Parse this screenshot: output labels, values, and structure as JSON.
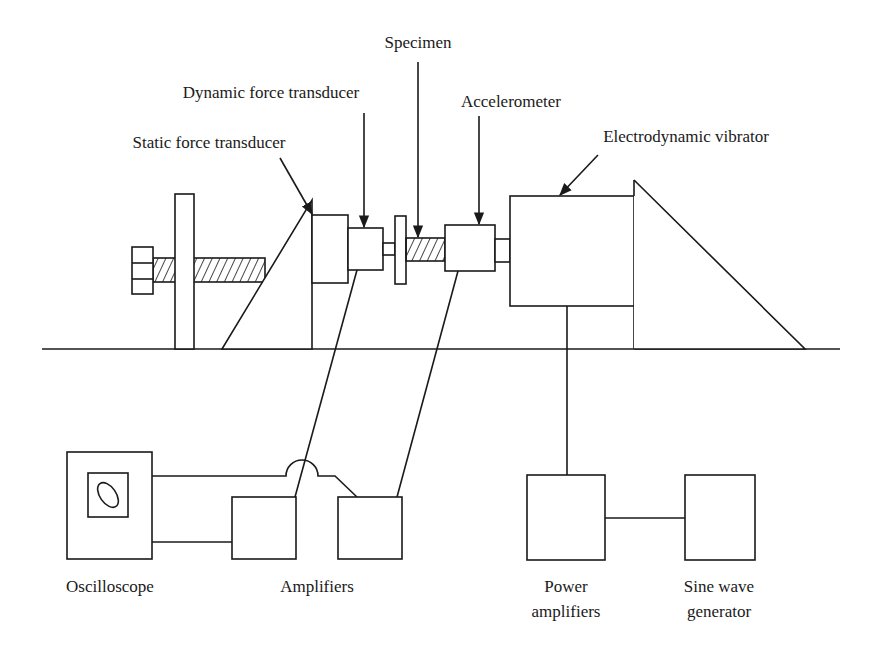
{
  "diagram": {
    "labels": {
      "specimen": "Specimen",
      "dynamic_force_transducer": "Dynamic force transducer",
      "accelerometer": "Accelerometer",
      "static_force_transducer": "Static force transducer",
      "electrodynamic_vibrator": "Electrodynamic vibrator",
      "oscilloscope": "Oscilloscope",
      "amplifiers": "Amplifiers",
      "power_amplifiers_line1": "Power",
      "power_amplifiers_line2": "amplifiers",
      "sine_wave_generator_line1": "Sine wave",
      "sine_wave_generator_line2": "generator"
    },
    "colors": {
      "stroke": "#1a1a1a",
      "background": "#ffffff"
    }
  }
}
